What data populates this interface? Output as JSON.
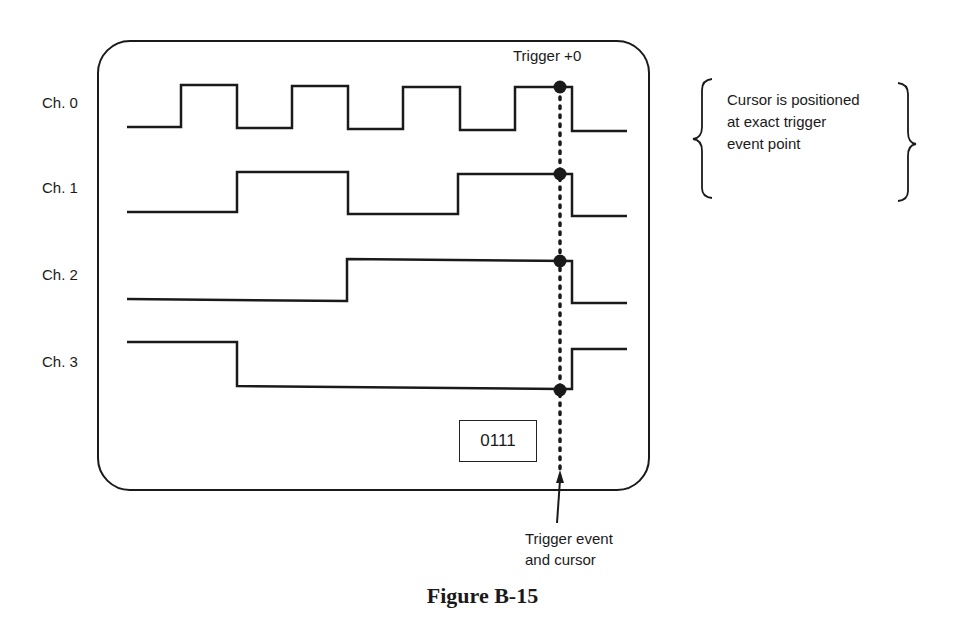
{
  "figure": {
    "caption": "Figure B-15",
    "trigger_label": "Trigger +0",
    "state_readout": "0111",
    "callout_note": [
      "Cursor is positioned",
      "at exact trigger",
      "event point"
    ],
    "cursor_label": [
      "Trigger event",
      "and cursor"
    ]
  },
  "channels": [
    {
      "label": "Ch. 0",
      "value_at_cursor": 0
    },
    {
      "label": "Ch. 1",
      "value_at_cursor": 1
    },
    {
      "label": "Ch. 2",
      "value_at_cursor": 1
    },
    {
      "label": "Ch. 3",
      "value_at_cursor": 1
    }
  ],
  "colors": {
    "ink": "#1a1a1a",
    "background": "#ffffff"
  }
}
